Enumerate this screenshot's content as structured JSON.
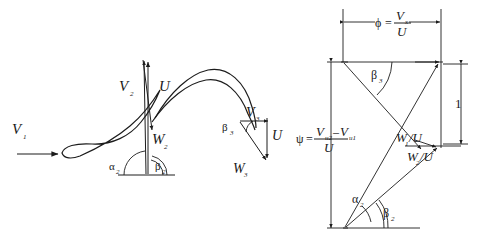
{
  "figure": {
    "background_color": "#ffffff",
    "line_color": "#1c1c1c",
    "text_color": "#1a1a1a"
  },
  "left_diagram": {
    "name": "blade-cascade-velocity-vectors",
    "labels": {
      "v1": "V",
      "v1_sub": "1",
      "v2": "V",
      "v2_sub": "2",
      "v3": "V",
      "v3_sub": "3",
      "u_mid": "U",
      "u_right": "U",
      "w2": "W",
      "w2_sub": "2",
      "w3": "W",
      "w3_sub": "3",
      "alpha2": "α",
      "alpha2_sub": "2",
      "beta2": "β",
      "beta2_sub": "2",
      "beta3": "β",
      "beta3_sub": "3"
    }
  },
  "right_diagram": {
    "name": "nondimensional-velocity-triangle",
    "phi": {
      "symbol": "ϕ",
      "equals": "=",
      "numerator": "V",
      "numerator_sub": "x",
      "denominator": "U"
    },
    "psi": {
      "symbol": "ψ",
      "equals": "=",
      "num_first": "V",
      "num_first_sub": "u2",
      "num_minus": "–",
      "num_second": "V",
      "num_second_sub": "u1",
      "denominator": "U"
    },
    "unit_label": "1",
    "labels": {
      "w1_over_u": "W",
      "w1_over_u_sub": "1",
      "w1_over_u_tail": "/U",
      "w2_over_u": "W",
      "w2_over_u_sub": "2",
      "w2_over_u_tail": "/U",
      "alpha2": "α",
      "alpha2_sub": "2",
      "beta2": "β",
      "beta2_sub": "2",
      "beta3": "β",
      "beta3_sub": "3"
    }
  }
}
